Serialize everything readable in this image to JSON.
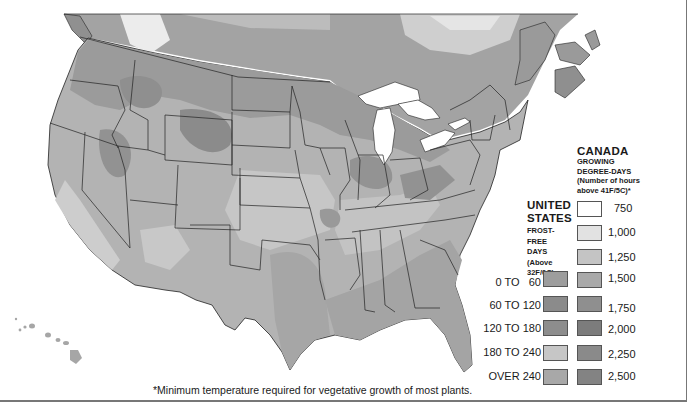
{
  "map": {
    "region": "United States and Southern Canada",
    "colors": {
      "background": "#ffffff",
      "water": "#ffffff",
      "border_line": "#222222",
      "zone_light": "#c9c9c9",
      "zone_mid": "#a9a9a9",
      "zone_dark": "#8c8c8c",
      "zone_lightest": "#e4e4e4"
    }
  },
  "legend_canada": {
    "title": "CANADA",
    "subtitle_lines": [
      "GROWING",
      "DEGREE-DAYS",
      "(Number of hours",
      "above 41F/5C)*"
    ],
    "items": [
      {
        "label": "750",
        "color": "#ffffff"
      },
      {
        "label": "1,000",
        "color": "#e2e2e2"
      },
      {
        "label": "1,250",
        "color": "#c4c4c4"
      },
      {
        "label": "1,500",
        "color": "#a9a9a9"
      },
      {
        "label": "1,750",
        "color": "#8f8f8f"
      },
      {
        "label": "2,000",
        "color": "#7c7c7c"
      },
      {
        "label": "2,250",
        "color": "#8a8a8a"
      },
      {
        "label": "2,500",
        "color": "#838383"
      }
    ]
  },
  "legend_us": {
    "title_lines": [
      "UNITED",
      "STATES"
    ],
    "subtitle_lines": [
      "FROST-",
      "FREE",
      "DAYS",
      "(Above",
      "32F/0C)"
    ],
    "items": [
      {
        "label": "0 TO   60",
        "color": "#9d9d9d"
      },
      {
        "label": "60 TO 120",
        "color": "#8b8b8b"
      },
      {
        "label": "120 TO 180",
        "color": "#8d8d8d"
      },
      {
        "label": "180 TO 240",
        "color": "#c6c6c6"
      },
      {
        "label": "OVER 240",
        "color": "#a8a8a8"
      }
    ]
  },
  "footnote": "*Minimum temperature required for vegetative growth of most plants."
}
